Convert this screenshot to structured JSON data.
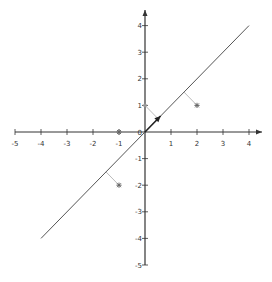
{
  "chart_data": {
    "type": "scatter",
    "title": "",
    "xlabel": "",
    "ylabel": "",
    "xlim": [
      -5,
      4.5
    ],
    "ylim": [
      -5,
      4.5
    ],
    "grid": false,
    "x_ticks": [
      -5,
      -4,
      -3,
      -2,
      -1,
      0,
      1,
      2,
      3,
      4
    ],
    "y_ticks": [
      -5,
      -4,
      -3,
      -2,
      -1,
      0,
      1,
      2,
      3,
      4
    ],
    "x_tick_labels": [
      "-5",
      "-4",
      "-3",
      "-2",
      "-1",
      "0",
      "1",
      "2",
      "3",
      "4"
    ],
    "y_tick_labels": [
      "-5",
      "-4",
      "-3",
      "-2",
      "-1",
      "0",
      "1",
      "2",
      "3",
      "4"
    ],
    "line": {
      "name": "y = x",
      "from": [
        -4,
        -4
      ],
      "to": [
        4,
        4
      ],
      "color": "#555555"
    },
    "vector": {
      "from": [
        0,
        0
      ],
      "to": [
        0.6,
        0.6
      ],
      "color": "#222222"
    },
    "points": [
      {
        "x": 2,
        "y": 1,
        "marker": "star",
        "projection": [
          1.5,
          1.5
        ]
      },
      {
        "x": -1,
        "y": -2,
        "marker": "star",
        "projection": [
          -1.5,
          -1.5
        ]
      },
      {
        "x": 0,
        "y": 1,
        "marker": "dot",
        "projection": [
          0.5,
          0.5
        ]
      },
      {
        "x": -1,
        "y": 0,
        "marker": "star",
        "projection": null
      }
    ],
    "colors": {
      "axis": "#333333",
      "line": "#555555",
      "projection": "#bbbbbb",
      "point": "#666666"
    }
  }
}
